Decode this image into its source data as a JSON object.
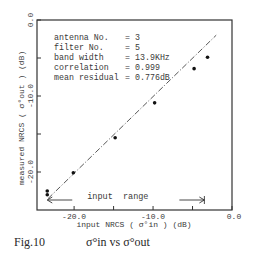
{
  "chart_data": {
    "type": "scatter",
    "title": "",
    "caption": {
      "figure_label": "Fig.10",
      "text": "σ°in vs σ°out"
    },
    "xlabel": "input NRCS ( σ°in ) (dB)",
    "ylabel": "measured NRCS ( σ°out ) (dB)",
    "xlim": [
      -24.7,
      0
    ],
    "ylim": [
      -25,
      0
    ],
    "grid": false,
    "x_ticks": [
      {
        "value": -20,
        "label": "-20.0"
      },
      {
        "value": -15,
        "label": ""
      },
      {
        "value": -10,
        "label": "-10.0"
      },
      {
        "value": -5,
        "label": ""
      },
      {
        "value": 0,
        "label": "0.0"
      }
    ],
    "y_ticks": [
      {
        "value": 0,
        "label": "0.0"
      },
      {
        "value": -5,
        "label": ""
      },
      {
        "value": -10,
        "label": "-10.0"
      },
      {
        "value": -15,
        "label": ""
      },
      {
        "value": -20,
        "label": "-20.0"
      }
    ],
    "series": [
      {
        "name": "measurements",
        "points": [
          {
            "x": -23.4,
            "y": -22.5
          },
          {
            "x": -23.4,
            "y": -23.0
          },
          {
            "x": -20.1,
            "y": -20.1
          },
          {
            "x": -14.8,
            "y": -15.5
          },
          {
            "x": -9.8,
            "y": -10.9
          },
          {
            "x": -4.8,
            "y": -6.4
          },
          {
            "x": -3.1,
            "y": -4.9
          }
        ]
      }
    ],
    "fit_line": {
      "style": "dash-dot",
      "from": {
        "x": -23.3,
        "y": -23.5
      },
      "to": {
        "x": -2.0,
        "y": -2.0
      }
    },
    "annotations": {
      "stats": [
        {
          "label": "antenna    No.",
          "value": "3"
        },
        {
          "label": "filter     No.",
          "value": "5"
        },
        {
          "label": "band width     ",
          "value": "13.9KHz"
        },
        {
          "label": "correlation    ",
          "value": "0.999"
        },
        {
          "label": "mean residual",
          "value": "0.776dB"
        }
      ],
      "input_range": {
        "text": "input  range",
        "from_x": -23.4,
        "to_x": -3.5
      }
    }
  }
}
